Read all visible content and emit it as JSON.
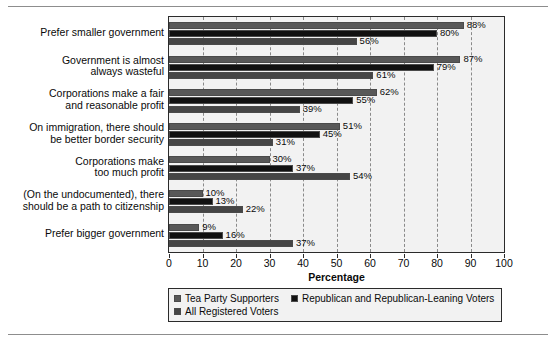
{
  "chart_data": {
    "type": "bar",
    "orientation": "horizontal",
    "title": "",
    "xlabel": "Percentage",
    "ylabel": "",
    "xlim": [
      0,
      100
    ],
    "xticks": [
      "0",
      "10",
      "20",
      "30",
      "40",
      "50",
      "60",
      "70",
      "80",
      "90",
      "100"
    ],
    "grid": "vertical-dashed",
    "legend_position": "bottom",
    "categories": [
      "Prefer smaller government",
      "Government is almost always wasteful",
      "Corporations make a fair and reasonable profit",
      "On immigration, there should be better border security",
      "Corporations make too much profit",
      "(On the undocumented), there should be a path to citizenship",
      "Prefer bigger government"
    ],
    "category_lines": [
      [
        "Prefer smaller government"
      ],
      [
        "Government is almost",
        "always wasteful"
      ],
      [
        "Corporations make a fair",
        "and reasonable profit"
      ],
      [
        "On immigration, there should",
        "be better border security"
      ],
      [
        "Corporations make",
        "too much profit"
      ],
      [
        "(On the undocumented), there",
        "should be a path to citizenship"
      ],
      [
        "Prefer bigger government"
      ]
    ],
    "series": [
      {
        "name": "Tea Party Supporters",
        "color": "#585858",
        "values": [
          88,
          87,
          62,
          51,
          30,
          10,
          9
        ],
        "labels": [
          "88%",
          "87%",
          "62%",
          "51%",
          "30%",
          "10%",
          "9%"
        ]
      },
      {
        "name": "Republican and Republican-Leaning Voters",
        "color": "#111111",
        "values": [
          80,
          79,
          55,
          45,
          37,
          13,
          16
        ],
        "labels": [
          "80%",
          "79%",
          "55%",
          "45%",
          "37%",
          "13%",
          "16%"
        ]
      },
      {
        "name": "All Registered Voters",
        "color": "#454545",
        "values": [
          56,
          61,
          39,
          31,
          54,
          22,
          37
        ],
        "labels": [
          "56%",
          "61%",
          "39%",
          "31%",
          "54%",
          "22%",
          "37%"
        ]
      }
    ]
  },
  "legend": {
    "row1": [
      {
        "label": "Tea Party Supporters",
        "swatch": "s0"
      },
      {
        "label": "Republican and Republican-Leaning Voters",
        "swatch": "s1"
      }
    ],
    "row2": [
      {
        "label": "All Registered Voters",
        "swatch": "s2"
      }
    ]
  }
}
